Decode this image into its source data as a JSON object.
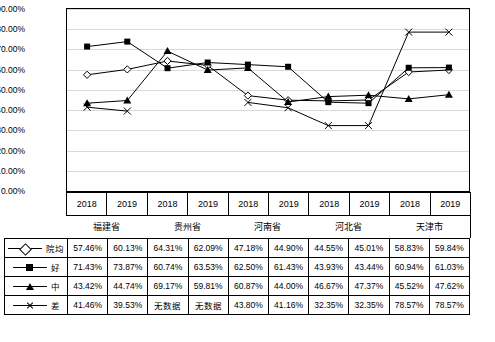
{
  "chart_data": {
    "type": "line",
    "title": "",
    "xlabel": "",
    "ylabel": "",
    "ylim": [
      0,
      0.9
    ],
    "ytick_labels": [
      "0.00%",
      "10.00%",
      "20.00%",
      "30.00%",
      "40.00%",
      "50.00%",
      "60.00%",
      "70.00%",
      "80.00%",
      "90.00%"
    ],
    "ytick_values": [
      0,
      0.1,
      0.2,
      0.3,
      0.4,
      0.5,
      0.6,
      0.7,
      0.8,
      0.9
    ],
    "grid": true,
    "legend_position": "table-left",
    "x": [
      "2018",
      "2019",
      "2018",
      "2019",
      "2018",
      "2019",
      "2018",
      "2019",
      "2018",
      "2019"
    ],
    "groups": [
      "福建省",
      "贵州省",
      "河南省",
      "河北省",
      "天津市"
    ],
    "series": [
      {
        "name": "院均",
        "marker": "diamond",
        "labels": [
          "57.46%",
          "60.13%",
          "64.31%",
          "62.09%",
          "47.18%",
          "44.90%",
          "44.55%",
          "45.01%",
          "58.83%",
          "59.84%"
        ],
        "values": [
          0.5746,
          0.6013,
          0.6431,
          0.6209,
          0.4718,
          0.449,
          0.4455,
          0.4501,
          0.5883,
          0.5984
        ]
      },
      {
        "name": "好",
        "marker": "square",
        "labels": [
          "71.43%",
          "73.87%",
          "60.74%",
          "63.53%",
          "62.50%",
          "61.43%",
          "43.93%",
          "43.44%",
          "60.94%",
          "61.03%"
        ],
        "values": [
          0.7143,
          0.7387,
          0.6074,
          0.6353,
          0.625,
          0.6143,
          0.4393,
          0.4344,
          0.6094,
          0.6103
        ]
      },
      {
        "name": "中",
        "marker": "triangle",
        "labels": [
          "43.42%",
          "44.74%",
          "69.17%",
          "59.81%",
          "60.87%",
          "44.00%",
          "46.67%",
          "47.37%",
          "45.52%",
          "47.62%"
        ],
        "values": [
          0.4342,
          0.4474,
          0.6917,
          0.5981,
          0.6087,
          0.44,
          0.4667,
          0.4737,
          0.4552,
          0.4762
        ]
      },
      {
        "name": "差",
        "marker": "x",
        "labels": [
          "41.46%",
          "39.53%",
          "无数据",
          "无数据",
          "43.80%",
          "41.16%",
          "32.35%",
          "32.35%",
          "78.57%",
          "78.57%"
        ],
        "values": [
          0.4146,
          0.3953,
          null,
          null,
          0.438,
          0.4116,
          0.3235,
          0.3235,
          0.7857,
          0.7857
        ]
      }
    ]
  },
  "table": {
    "row_headers": [
      "院均",
      "好",
      "中",
      "差"
    ]
  }
}
